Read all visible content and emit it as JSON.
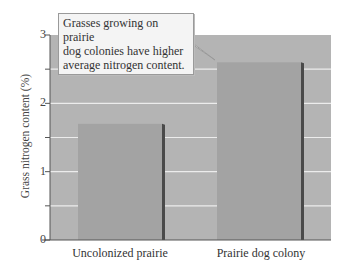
{
  "chart_data": {
    "type": "bar",
    "title": "",
    "xlabel": "",
    "ylabel": "Grass nitrogen content (%)",
    "categories": [
      "Uncolonized prairie",
      "Prairie dog colony"
    ],
    "values": [
      1.7,
      2.6
    ],
    "ylim": [
      0,
      3
    ],
    "yticks": [
      0,
      1,
      2,
      3
    ],
    "minor_gridlines": [
      0.5,
      1.5,
      2.5
    ],
    "grid": true,
    "legend": null,
    "annotation": "Grasses growing on prairie dog colonies have higher average nitrogen content."
  },
  "colors": {
    "plot_background": "#b4b4b4",
    "bar_fill": "#a3a3a3",
    "bar_shadow": "#4a4a4a",
    "gridline": "#ececec",
    "axis": "#555555",
    "callout_fill": "#f4f4f4"
  },
  "labels": {
    "y0": "0",
    "y1": "1",
    "y2": "2",
    "y3": "3",
    "cat0": "Uncolonized prairie",
    "cat1": "Prairie dog colony",
    "ylabel": "Grass nitrogen content (%)",
    "callout_line1": "Grasses growing on prairie",
    "callout_line2": "dog colonies have higher",
    "callout_line3": "average nitrogen content."
  }
}
